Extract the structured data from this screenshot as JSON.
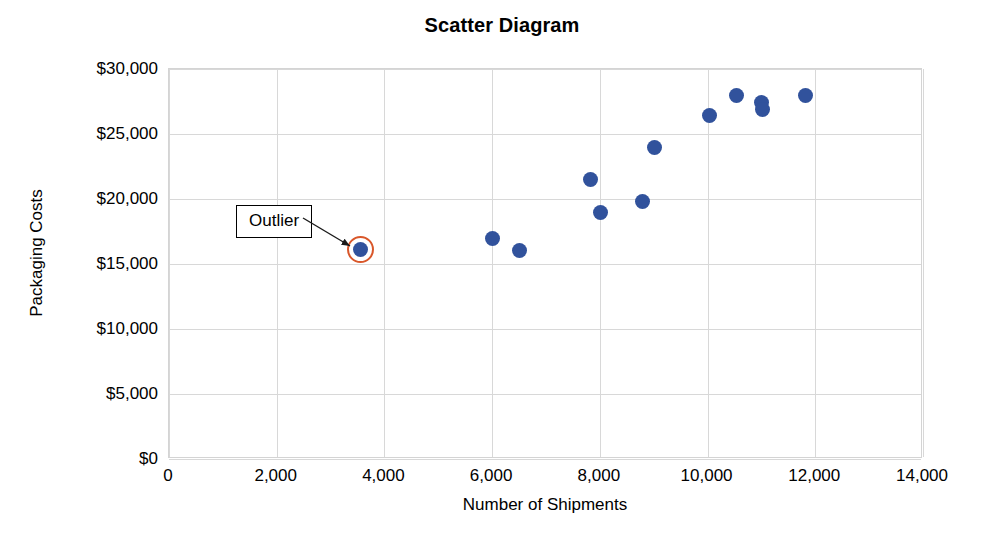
{
  "chart_data": {
    "type": "scatter",
    "title": "Scatter Diagram",
    "xlabel": "Number of Shipments",
    "ylabel": "Packaging Costs",
    "xlim": [
      0,
      14000
    ],
    "ylim": [
      0,
      30000
    ],
    "grid": true,
    "legend": "none",
    "marker_color": "#31529c",
    "highlight_color": "#d9572a",
    "x_ticks": [
      {
        "value": 0,
        "label": "0"
      },
      {
        "value": 2000,
        "label": "2,000"
      },
      {
        "value": 4000,
        "label": "4,000"
      },
      {
        "value": 6000,
        "label": "6,000"
      },
      {
        "value": 8000,
        "label": "8,000"
      },
      {
        "value": 10000,
        "label": "10,000"
      },
      {
        "value": 12000,
        "label": "12,000"
      },
      {
        "value": 14000,
        "label": "14,000"
      }
    ],
    "y_ticks": [
      {
        "value": 0,
        "label": "$0"
      },
      {
        "value": 5000,
        "label": "$5,000"
      },
      {
        "value": 10000,
        "label": "$10,000"
      },
      {
        "value": 15000,
        "label": "$15,000"
      },
      {
        "value": 20000,
        "label": "$20,000"
      },
      {
        "value": 25000,
        "label": "$25,000"
      },
      {
        "value": 30000,
        "label": "$30,000"
      }
    ],
    "points": [
      {
        "x": 3550,
        "y": 16100,
        "highlighted": true
      },
      {
        "x": 6000,
        "y": 17000,
        "highlighted": false
      },
      {
        "x": 6500,
        "y": 16050,
        "highlighted": false
      },
      {
        "x": 7820,
        "y": 21500,
        "highlighted": false
      },
      {
        "x": 8020,
        "y": 19000,
        "highlighted": false
      },
      {
        "x": 8800,
        "y": 19800,
        "highlighted": false
      },
      {
        "x": 9020,
        "y": 24000,
        "highlighted": false
      },
      {
        "x": 10030,
        "y": 26400,
        "highlighted": false
      },
      {
        "x": 10530,
        "y": 28000,
        "highlighted": false
      },
      {
        "x": 11000,
        "y": 27400,
        "highlighted": false
      },
      {
        "x": 11020,
        "y": 26850,
        "highlighted": false
      },
      {
        "x": 11820,
        "y": 27950,
        "highlighted": false
      }
    ],
    "annotations": [
      {
        "text": "Outlier",
        "target_x": 3550,
        "target_y": 16100
      }
    ]
  }
}
